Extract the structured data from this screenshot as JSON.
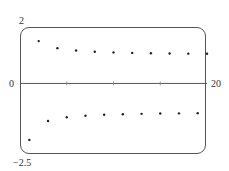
{
  "chart_data": {
    "type": "scatter",
    "title": "",
    "xlabel": "",
    "ylabel": "",
    "xlim": [
      0,
      20
    ],
    "ylim": [
      -2.5,
      2
    ],
    "x_tick_labels": [
      "0",
      "20"
    ],
    "y_tick_labels": [
      "2",
      "-2.5"
    ],
    "x_minor_ticks": [
      5,
      10,
      15
    ],
    "grid": false,
    "legend": null,
    "series": [
      {
        "name": "a_n = (-1)^n (1 + 1/n)",
        "x": [
          1,
          2,
          3,
          4,
          5,
          6,
          7,
          8,
          9,
          10,
          11,
          12,
          13,
          14,
          15,
          16,
          17,
          18,
          19,
          20
        ],
        "y": [
          -2,
          1.5,
          -1.333,
          1.25,
          -1.2,
          1.167,
          -1.143,
          1.125,
          -1.111,
          1.1,
          -1.091,
          1.083,
          -1.077,
          1.071,
          -1.067,
          1.063,
          -1.059,
          1.056,
          -1.053,
          1.05
        ]
      }
    ]
  },
  "labels": {
    "y_top": "2",
    "y_bottom": "−2.5",
    "x_origin": "0",
    "x_right": "20"
  }
}
